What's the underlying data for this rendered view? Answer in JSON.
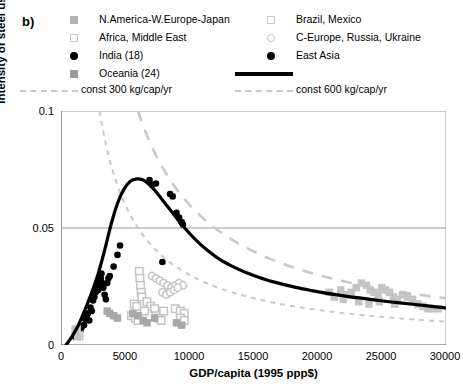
{
  "panel": {
    "label": "b)"
  },
  "legend": {
    "columns": [
      [
        {
          "marker": "gray-filled-square-light",
          "label": "N.America-W.Europe-Japan"
        },
        {
          "marker": "gray-open-square",
          "label": "Africa, Middle East"
        },
        {
          "marker": "black-filled-circle",
          "label": "India (18)"
        },
        {
          "marker": "gray-filled-square-mid",
          "label": "Oceania (24)"
        },
        {
          "marker": "gray-dashed-line",
          "label": "const 300 kg/cap/yr"
        }
      ],
      [
        {
          "marker": "gray-open-square",
          "label": "Brazil, Mexico"
        },
        {
          "marker": "gray-open-circle",
          "label": "C-Europe, Russia, Ukraine"
        },
        {
          "marker": "black-filled-circle",
          "label": "East Asia"
        },
        {
          "marker": "black-solid-line",
          "label": ""
        },
        {
          "marker": "gray-dashed-line",
          "label": "const 600 kg/cap/yr"
        }
      ]
    ]
  },
  "axes": {
    "xlabel": "GDP/capita (1995 ppp$)",
    "ylabel": "Intensity of steel use (kg/1995 ppp$)",
    "xticks": [
      "0",
      "5000",
      "10000",
      "15000",
      "20000",
      "25000",
      "30000"
    ],
    "yticks": [
      "0",
      "0.05",
      "0.1"
    ]
  },
  "colors": {
    "axis": "#555555",
    "grid": "#9a9a9a",
    "black": "#000000",
    "gray_light": "#c4c4c4",
    "gray_mid": "#a8a8a8",
    "gray_dark": "#8e8e8e",
    "dash": "#c9c9c9"
  },
  "chart_data": {
    "type": "scatter",
    "title": "",
    "xlabel": "GDP/capita (1995 ppp$)",
    "ylabel": "Intensity of steel use (kg/1995 ppp$)",
    "xlim": [
      0,
      30000
    ],
    "ylim": [
      0,
      0.1
    ],
    "xticks": [
      0,
      5000,
      10000,
      15000,
      20000,
      25000,
      30000
    ],
    "yticks": [
      0,
      0.05,
      0.1
    ],
    "grid": "horizontal-at-0.05-and-0.1",
    "legend_position": "above-plot",
    "series": [
      {
        "name": "East Asia",
        "marker": "black-filled-circle",
        "points": [
          [
            1100,
            0.0035
          ],
          [
            1500,
            0.006
          ],
          [
            1800,
            0.0085
          ],
          [
            2000,
            0.012
          ],
          [
            2200,
            0.0105
          ],
          [
            2400,
            0.0145
          ],
          [
            2500,
            0.019
          ],
          [
            2700,
            0.0225
          ],
          [
            2800,
            0.0255
          ],
          [
            2900,
            0.0235
          ],
          [
            3000,
            0.027
          ],
          [
            3100,
            0.0285
          ],
          [
            3150,
            0.0305
          ],
          [
            3200,
            0.0265
          ],
          [
            3300,
            0.0245
          ],
          [
            3400,
            0.0215
          ],
          [
            3500,
            0.0195
          ],
          [
            3600,
            0.0265
          ],
          [
            3700,
            0.0285
          ],
          [
            3800,
            0.0295
          ],
          [
            4100,
            0.0335
          ],
          [
            4400,
            0.0385
          ],
          [
            4600,
            0.0425
          ],
          [
            6900,
            0.0705
          ],
          [
            7100,
            0.0685
          ],
          [
            7400,
            0.069
          ],
          [
            8500,
            0.0645
          ],
          [
            8700,
            0.0635
          ],
          [
            9000,
            0.0565
          ],
          [
            9200,
            0.0545
          ],
          [
            9400,
            0.0525
          ],
          [
            9500,
            0.0515
          ],
          [
            7900,
            0.0355
          ]
        ]
      },
      {
        "name": "India (18)",
        "marker": "black-filled-circle",
        "points": [
          [
            1200,
            0.004
          ],
          [
            1400,
            0.0055
          ],
          [
            1600,
            0.0075
          ],
          [
            1900,
            0.011
          ],
          [
            2100,
            0.0135
          ],
          [
            2300,
            0.016
          ],
          [
            2600,
            0.0205
          ],
          [
            2850,
            0.024
          ],
          [
            3050,
            0.0275
          ],
          [
            3250,
            0.0255
          ]
        ]
      },
      {
        "name": "Brazil, Mexico",
        "marker": "gray-open-square",
        "points": [
          [
            6100,
            0.0315
          ],
          [
            6150,
            0.0285
          ],
          [
            6200,
            0.0255
          ],
          [
            6250,
            0.0225
          ],
          [
            6300,
            0.0205
          ],
          [
            6700,
            0.0185
          ],
          [
            7000,
            0.0165
          ],
          [
            7300,
            0.0155
          ],
          [
            5700,
            0.0175
          ],
          [
            5900,
            0.0165
          ],
          [
            8900,
            0.0155
          ],
          [
            9300,
            0.0145
          ],
          [
            9600,
            0.0135
          ],
          [
            6500,
            0.0145
          ]
        ]
      },
      {
        "name": "C-Europe, Russia, Ukraine",
        "marker": "gray-open-circle",
        "points": [
          [
            7100,
            0.0295
          ],
          [
            7400,
            0.0285
          ],
          [
            7700,
            0.0275
          ],
          [
            8000,
            0.0265
          ],
          [
            8300,
            0.0255
          ],
          [
            8600,
            0.0245
          ],
          [
            8900,
            0.0255
          ],
          [
            9200,
            0.0265
          ],
          [
            9500,
            0.0255
          ],
          [
            7900,
            0.0225
          ],
          [
            8200,
            0.0215
          ],
          [
            8500,
            0.0225
          ],
          [
            8800,
            0.0235
          ],
          [
            9100,
            0.0245
          ]
        ]
      },
      {
        "name": "Africa, Middle East",
        "marker": "gray-open-square",
        "points": [
          [
            1200,
            0.0065
          ],
          [
            1400,
            0.004
          ],
          [
            5500,
            0.0125
          ],
          [
            5800,
            0.0115
          ],
          [
            6000,
            0.0105
          ],
          [
            7400,
            0.0125
          ],
          [
            7600,
            0.0115
          ],
          [
            7800,
            0.0105
          ],
          [
            8000,
            0.0145
          ],
          [
            9300,
            0.0115
          ],
          [
            9600,
            0.0105
          ]
        ]
      },
      {
        "name": "Oceania (24)",
        "marker": "gray-filled-square-mid",
        "points": [
          [
            3600,
            0.0145
          ],
          [
            3800,
            0.0135
          ],
          [
            4100,
            0.0125
          ],
          [
            4400,
            0.0115
          ],
          [
            5600,
            0.0135
          ],
          [
            6000,
            0.0125
          ],
          [
            6400,
            0.0105
          ],
          [
            6700,
            0.0095
          ],
          [
            7300,
            0.0115
          ],
          [
            9000,
            0.0095
          ],
          [
            9400,
            0.0085
          ]
        ]
      },
      {
        "name": "N.America-W.Europe-Japan",
        "marker": "gray-filled-square-light",
        "points": [
          [
            1100,
            0.0065
          ],
          [
            1300,
            0.0035
          ],
          [
            21800,
            0.0235
          ],
          [
            22200,
            0.0215
          ],
          [
            22600,
            0.0225
          ],
          [
            23000,
            0.0245
          ],
          [
            23400,
            0.0265
          ],
          [
            23800,
            0.0255
          ],
          [
            24100,
            0.0235
          ],
          [
            24400,
            0.0225
          ],
          [
            24700,
            0.0215
          ],
          [
            25000,
            0.0245
          ],
          [
            25300,
            0.0235
          ],
          [
            25600,
            0.0225
          ],
          [
            25900,
            0.0205
          ],
          [
            26200,
            0.0195
          ],
          [
            26600,
            0.0215
          ],
          [
            27000,
            0.0205
          ],
          [
            27400,
            0.0195
          ],
          [
            27800,
            0.0175
          ],
          [
            28200,
            0.0165
          ],
          [
            28600,
            0.0155
          ],
          [
            29000,
            0.0155
          ],
          [
            29400,
            0.0155
          ],
          [
            22000,
            0.0195
          ],
          [
            23200,
            0.0185
          ],
          [
            24000,
            0.0175
          ],
          [
            24800,
            0.0185
          ],
          [
            26000,
            0.0175
          ],
          [
            20900,
            0.0225
          ],
          [
            21300,
            0.0205
          ]
        ]
      }
    ],
    "curves": [
      {
        "name": "East Asia fit",
        "style": "black-solid",
        "points": [
          [
            400,
            0.0
          ],
          [
            900,
            0.004
          ],
          [
            1400,
            0.009
          ],
          [
            1900,
            0.0155
          ],
          [
            2400,
            0.0225
          ],
          [
            2900,
            0.0305
          ],
          [
            3400,
            0.0405
          ],
          [
            3900,
            0.0515
          ],
          [
            4400,
            0.0605
          ],
          [
            4900,
            0.0665
          ],
          [
            5400,
            0.07
          ],
          [
            5900,
            0.071
          ],
          [
            6400,
            0.0705
          ],
          [
            6900,
            0.0685
          ],
          [
            7400,
            0.0655
          ],
          [
            7900,
            0.062
          ],
          [
            8400,
            0.0585
          ],
          [
            8900,
            0.055
          ],
          [
            9400,
            0.0515
          ],
          [
            10400,
            0.0455
          ],
          [
            11400,
            0.0405
          ],
          [
            12400,
            0.0365
          ],
          [
            13400,
            0.0335
          ],
          [
            14400,
            0.031
          ],
          [
            15400,
            0.029
          ],
          [
            16400,
            0.0272
          ],
          [
            17400,
            0.0258
          ],
          [
            18400,
            0.0245
          ],
          [
            19400,
            0.0234
          ],
          [
            20400,
            0.0224
          ],
          [
            21400,
            0.0215
          ],
          [
            22400,
            0.0207
          ],
          [
            23400,
            0.02
          ],
          [
            24400,
            0.0193
          ],
          [
            25400,
            0.0186
          ],
          [
            26400,
            0.018
          ],
          [
            27400,
            0.0174
          ],
          [
            28400,
            0.0168
          ],
          [
            29400,
            0.0162
          ],
          [
            30000,
            0.0158
          ]
        ]
      },
      {
        "name": "const 300 kg/cap/yr",
        "style": "gray-dashed",
        "formula": "y = 300 / x",
        "xrange": [
          3000,
          30000
        ]
      },
      {
        "name": "const 600 kg/cap/yr",
        "style": "gray-dashed-long",
        "formula": "y = 600 / x",
        "xrange": [
          6000,
          30000
        ]
      }
    ]
  }
}
